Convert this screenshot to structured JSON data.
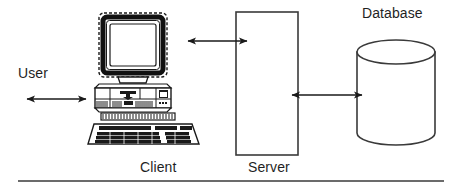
{
  "diagram": {
    "type": "architecture-block-diagram",
    "style": {
      "background": "#ffffff",
      "stroke": "#1a1a1a",
      "label_color": "#1f1f1f",
      "monitor_bezel": "#111111",
      "screen_fill": "#ffffff"
    },
    "labels": {
      "user": "User",
      "client": "Client",
      "server": "Server",
      "database": "Database"
    },
    "nodes": [
      {
        "id": "user",
        "label": "User",
        "shape": "text-only",
        "x": 18,
        "y": 66
      },
      {
        "id": "client",
        "label": "Client",
        "shape": "desktop-computer-illustration",
        "parts": [
          "crt-monitor",
          "desktop-base-unit",
          "keyboard"
        ],
        "x": 88,
        "y": 12,
        "width": 116,
        "height": 134
      },
      {
        "id": "server",
        "label": "Server",
        "shape": "rectangle",
        "x": 236,
        "y": 12,
        "width": 62,
        "height": 143
      },
      {
        "id": "database",
        "label": "Database",
        "shape": "cylinder",
        "x": 357,
        "y": 41,
        "width": 78,
        "height": 104
      }
    ],
    "connectors": [
      {
        "id": "user-to-client",
        "from": "user",
        "to": "client",
        "arrowheads": "both",
        "orientation": "horizontal",
        "y": 99
      },
      {
        "id": "client-to-server",
        "from": "client",
        "to": "server",
        "arrowheads": "both",
        "orientation": "horizontal",
        "y": 41
      },
      {
        "id": "server-to-database",
        "from": "server",
        "to": "database",
        "arrowheads": "both",
        "orientation": "horizontal",
        "y": 95
      }
    ],
    "footer_rule": {
      "present": true,
      "x1": 18,
      "x2": 444,
      "y": 181
    }
  }
}
